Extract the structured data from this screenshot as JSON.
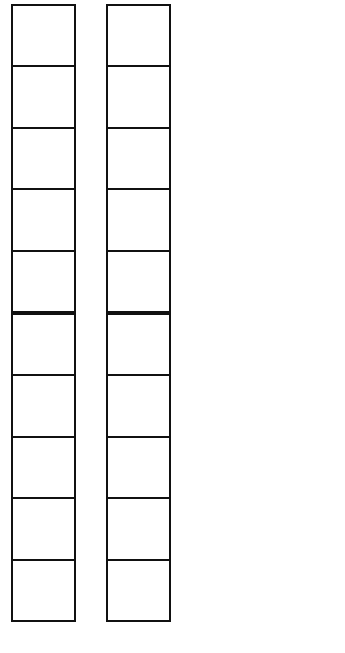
{
  "diagram": {
    "type": "ten-frame-strips",
    "background": "#ffffff",
    "line_color": "#111111",
    "strips": [
      {
        "id": "left",
        "cells": 10,
        "filled": [
          false,
          false,
          false,
          false,
          false,
          false,
          false,
          false,
          false,
          false
        ],
        "thick_divider_after": 5
      },
      {
        "id": "right",
        "cells": 10,
        "filled": [
          false,
          false,
          false,
          false,
          false,
          false,
          false,
          false,
          false,
          false
        ],
        "thick_divider_after": 5
      }
    ]
  }
}
